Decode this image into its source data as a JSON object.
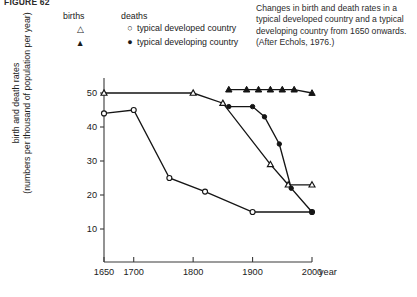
{
  "figure": {
    "number": "FIGURE 62"
  },
  "caption": {
    "text": "Changes in birth and death rates in a typical developed country and a typical developing country from 1650 onwards. (After Echols, 1976.)"
  },
  "legend": {
    "heading_births": "births",
    "heading_deaths": "deaths",
    "rows": [
      {
        "births_marker": "△",
        "deaths_marker": "○",
        "label": "typical developed country"
      },
      {
        "births_marker": "▲",
        "deaths_marker": "●",
        "label": "typical developing country"
      }
    ]
  },
  "axes": {
    "ylabel_line1": "birth and death rates",
    "ylabel_line2": "(numbers per thousand of population per year)",
    "xlabel": "year",
    "yticks": [
      10,
      20,
      30,
      40,
      50
    ],
    "xticks": [
      1650,
      1700,
      1800,
      1900,
      2000
    ]
  },
  "chart_data": {
    "type": "line",
    "title": "Changes in birth and death rates in a typical developed country and a typical developing country from 1650 onwards",
    "xlabel": "year",
    "ylabel": "birth and death rates (numbers per thousand of population per year)",
    "xlim": [
      1650,
      2000
    ],
    "ylim": [
      0,
      55
    ],
    "yticks": [
      10,
      20,
      30,
      40,
      50
    ],
    "xticks": [
      1650,
      1700,
      1800,
      1900,
      2000
    ],
    "grid": false,
    "legend_position": "top-left",
    "series": [
      {
        "name": "typical developed country — births",
        "marker": "open-triangle",
        "points": [
          {
            "x": 1650,
            "y": 50
          },
          {
            "x": 1800,
            "y": 50
          },
          {
            "x": 1850,
            "y": 47
          },
          {
            "x": 1930,
            "y": 29
          },
          {
            "x": 1960,
            "y": 23
          },
          {
            "x": 2000,
            "y": 23
          }
        ]
      },
      {
        "name": "typical developed country — deaths",
        "marker": "open-circle",
        "points": [
          {
            "x": 1650,
            "y": 44
          },
          {
            "x": 1700,
            "y": 45
          },
          {
            "x": 1760,
            "y": 25
          },
          {
            "x": 1820,
            "y": 21
          },
          {
            "x": 1900,
            "y": 15
          },
          {
            "x": 2000,
            "y": 15
          }
        ]
      },
      {
        "name": "typical developing country — births",
        "marker": "filled-triangle",
        "points": [
          {
            "x": 1860,
            "y": 51
          },
          {
            "x": 1890,
            "y": 51
          },
          {
            "x": 1910,
            "y": 51
          },
          {
            "x": 1930,
            "y": 51
          },
          {
            "x": 1950,
            "y": 51
          },
          {
            "x": 1970,
            "y": 51
          },
          {
            "x": 2000,
            "y": 50
          }
        ]
      },
      {
        "name": "typical developing country — deaths",
        "marker": "filled-circle",
        "points": [
          {
            "x": 1860,
            "y": 46
          },
          {
            "x": 1900,
            "y": 46
          },
          {
            "x": 1920,
            "y": 43
          },
          {
            "x": 1945,
            "y": 35
          },
          {
            "x": 1965,
            "y": 22
          },
          {
            "x": 2000,
            "y": 15
          }
        ]
      }
    ]
  }
}
